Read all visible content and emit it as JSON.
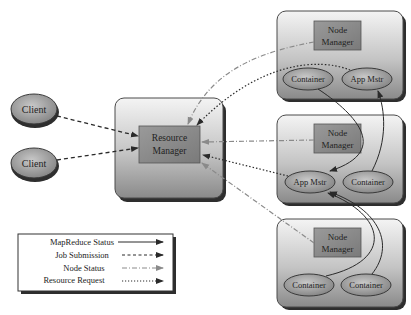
{
  "diagram": {
    "clients": [
      {
        "id": "client1",
        "label": "Client"
      },
      {
        "id": "client2",
        "label": "Client"
      }
    ],
    "resource_manager": {
      "label_line1": "Resource",
      "label_line2": "Manager"
    },
    "nodes": [
      {
        "id": "node1",
        "manager": {
          "line1": "Node",
          "line2": "Manager"
        },
        "left_ellipse": "Container",
        "right_ellipse": "App Mstr"
      },
      {
        "id": "node2",
        "manager": {
          "line1": "Node",
          "line2": "Manager"
        },
        "left_ellipse": "App Mstr",
        "right_ellipse": "Container"
      },
      {
        "id": "node3",
        "manager": {
          "line1": "Node",
          "line2": "Manager"
        },
        "left_ellipse": "Container",
        "right_ellipse": "Container"
      }
    ],
    "legend": {
      "items": [
        {
          "label": "MapReduce Status",
          "style": "solid"
        },
        {
          "label": "Job Submission",
          "style": "dashed"
        },
        {
          "label": "Node Status",
          "style": "dash-dot"
        },
        {
          "label": "Resource Request",
          "style": "dotted"
        }
      ]
    },
    "edges": [
      {
        "from": "client1",
        "to": "resource_manager",
        "type": "Job Submission"
      },
      {
        "from": "client2",
        "to": "resource_manager",
        "type": "Job Submission"
      },
      {
        "from": "node1.manager",
        "to": "resource_manager",
        "type": "Node Status"
      },
      {
        "from": "node2.manager",
        "to": "resource_manager",
        "type": "Node Status"
      },
      {
        "from": "node3.manager",
        "to": "resource_manager",
        "type": "Node Status"
      },
      {
        "from": "node1.app_mstr",
        "to": "resource_manager",
        "type": "Resource Request"
      },
      {
        "from": "node2.app_mstr",
        "to": "resource_manager",
        "type": "Resource Request"
      },
      {
        "from": "node1.container",
        "to": "node2.app_mstr",
        "type": "MapReduce Status"
      },
      {
        "from": "node2.container",
        "to": "node1.app_mstr",
        "type": "MapReduce Status"
      },
      {
        "from": "node3.container1",
        "to": "node2.app_mstr",
        "type": "MapReduce Status"
      },
      {
        "from": "node3.container2",
        "to": "node2.app_mstr",
        "type": "MapReduce Status"
      }
    ],
    "colors": {
      "box_fill_top": "#f2f2f2",
      "box_fill_bottom": "#8e8e8e",
      "inner_box": "#8a8a8a",
      "ellipse": "#9a9a9a",
      "shadow": "#333333",
      "line": "#333333",
      "node_status_line": "#8c8c8c"
    }
  }
}
